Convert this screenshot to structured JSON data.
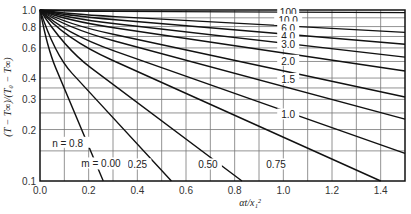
{
  "chart_data": {
    "type": "line",
    "title": "",
    "xlabel": "αt/x₁²",
    "ylabel": "(T − T∞)/(T₀ − T∞)",
    "xlim": [
      0.0,
      1.5
    ],
    "ylim": [
      0.1,
      1.0
    ],
    "yscale": "log",
    "grid": true,
    "x_ticks": [
      "0.0",
      "0.2",
      "0.4",
      "0.6",
      "0.8",
      "1.0",
      "1.2",
      "1.4"
    ],
    "y_ticks": [
      "0.1",
      "0.2",
      "0.3",
      "0.4",
      "0.6",
      "0.8",
      "1.0"
    ],
    "annotations": [
      {
        "text": "n = 0.8",
        "x": 0.05,
        "y": 0.165
      },
      {
        "text": "m = 0.00",
        "x": 0.17,
        "y": 0.125
      }
    ],
    "series": [
      {
        "name": "100",
        "label": "100",
        "points": [
          [
            0,
            1.0
          ],
          [
            0.1,
            0.985
          ],
          [
            1.5,
            0.965
          ]
        ],
        "label_pos": [
          1.02,
          0.975
        ]
      },
      {
        "name": "10.0",
        "label": "10.0",
        "points": [
          [
            0,
            1.0
          ],
          [
            0.1,
            0.95
          ],
          [
            1.5,
            0.74
          ]
        ],
        "label_pos": [
          1.02,
          0.875
        ]
      },
      {
        "name": "6.0",
        "label": "6.0",
        "points": [
          [
            0,
            1.0
          ],
          [
            0.1,
            0.93
          ],
          [
            1.5,
            0.63
          ]
        ],
        "label_pos": [
          1.02,
          0.79
        ]
      },
      {
        "name": "4.0",
        "label": "4.0",
        "points": [
          [
            0,
            1.0
          ],
          [
            0.1,
            0.9
          ],
          [
            1.5,
            0.53
          ]
        ],
        "label_pos": [
          1.02,
          0.7
        ]
      },
      {
        "name": "3.0",
        "label": "3.0",
        "points": [
          [
            0,
            1.0
          ],
          [
            0.1,
            0.87
          ],
          [
            1.5,
            0.44
          ]
        ],
        "label_pos": [
          1.02,
          0.63
        ]
      },
      {
        "name": "2.0",
        "label": "2.0",
        "points": [
          [
            0,
            1.0
          ],
          [
            0.1,
            0.83
          ],
          [
            1.5,
            0.31
          ]
        ],
        "label_pos": [
          1.02,
          0.505
        ]
      },
      {
        "name": "1.5",
        "label": "1.5",
        "points": [
          [
            0,
            1.0
          ],
          [
            0.1,
            0.79
          ],
          [
            1.5,
            0.23
          ]
        ],
        "label_pos": [
          1.02,
          0.395
        ]
      },
      {
        "name": "1.0",
        "label": "1.0",
        "points": [
          [
            0,
            1.0
          ],
          [
            0.1,
            0.73
          ],
          [
            1.5,
            0.145
          ]
        ],
        "label_pos": [
          1.02,
          0.245
        ]
      },
      {
        "name": "0.75",
        "label": "0.75",
        "points": [
          [
            0,
            1.0
          ],
          [
            0.1,
            0.68
          ],
          [
            1.4,
            0.1
          ]
        ],
        "label_pos": [
          0.97,
          0.125
        ]
      },
      {
        "name": "0.50",
        "label": "0.50",
        "points": [
          [
            0,
            1.0
          ],
          [
            0.1,
            0.6
          ],
          [
            0.83,
            0.1
          ]
        ],
        "label_pos": [
          0.69,
          0.125
        ]
      },
      {
        "name": "0.25",
        "label": "0.25",
        "points": [
          [
            0,
            1.0
          ],
          [
            0.06,
            0.55
          ],
          [
            0.54,
            0.1
          ]
        ],
        "label_pos": [
          0.4,
          0.125
        ]
      },
      {
        "name": "0.00",
        "label": "0.00",
        "points": [
          [
            0,
            1.0
          ],
          [
            0.03,
            0.6
          ],
          [
            0.26,
            0.1
          ]
        ],
        "label_pos": [
          0.26,
          0.125
        ]
      }
    ]
  }
}
